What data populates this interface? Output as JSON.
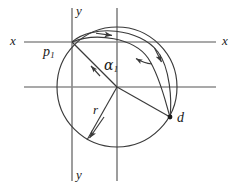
{
  "figure": {
    "kind": "geometry-diagram",
    "title": "",
    "background_color": "#ffffff",
    "axis_color": "#8c8c8c",
    "curve_color": "#3a3a3a",
    "label_color": "#1a1a1a",
    "width": 241,
    "height": 189
  },
  "labels": {
    "x_left": "x",
    "x_right": "x",
    "y_top": "y",
    "y_bottom": "y",
    "point_p1_base": "p",
    "point_p1_sub": "1",
    "angle_alpha_base": "α",
    "angle_alpha_sub": "1",
    "radius": "r",
    "point_d": "d"
  },
  "geometry": {
    "circle": {
      "cx": 117,
      "cy": 87,
      "r": 60
    },
    "axes": {
      "horizontal_upper_y": 42,
      "horizontal_lower_y": 87,
      "vertical_left_x": 72,
      "vertical_right_x": 117,
      "horizontal_span": [
        24,
        216
      ],
      "vertical_span": [
        8,
        181
      ]
    },
    "points": {
      "p1": [
        72,
        42
      ],
      "center": [
        117,
        87
      ],
      "d": [
        170,
        117
      ]
    },
    "markers": {
      "d_dot_radius": 2.4
    }
  },
  "annotations": {
    "arc_arrow_top": "arrowhead-right",
    "arc_arrow_right": "arrowhead-down",
    "alpha_pointer": "arrow-left",
    "radius_arrow_out": "arrowhead-down-left",
    "radius_arrow_in": "arrowhead-up-left"
  }
}
